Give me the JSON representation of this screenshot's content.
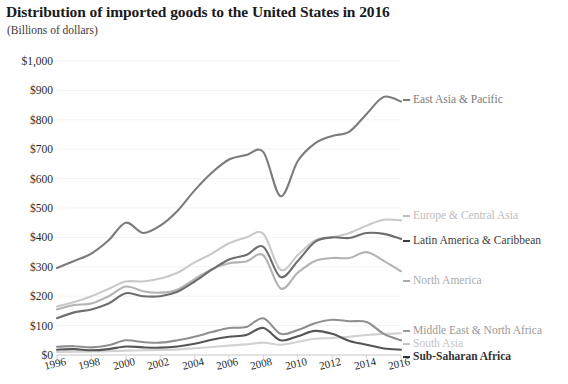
{
  "header": {
    "title": "Distribution of imported goods to the United States in 2016",
    "subtitle": "(Billions of dollars)"
  },
  "chart_data": {
    "type": "line",
    "title": "Distribution of imported goods to the United States in 2016",
    "subtitle": "(Billions of dollars)",
    "xlabel": "",
    "ylabel": "Billions of dollars",
    "xlim": [
      1996,
      2016
    ],
    "ylim": [
      0,
      1000
    ],
    "grid": true,
    "legend_position": "right-inline",
    "y_ticks": [
      "$0",
      "$100",
      "$200",
      "$300",
      "$400",
      "$500",
      "$600",
      "$700",
      "$800",
      "$900",
      "$1,000"
    ],
    "y_tick_values": [
      0,
      100,
      200,
      300,
      400,
      500,
      600,
      700,
      800,
      900,
      1000
    ],
    "x_ticks": [
      "1996",
      "1998",
      "2000",
      "2002",
      "2004",
      "2006",
      "2008",
      "2010",
      "2012",
      "2014",
      "2016"
    ],
    "x": [
      1996,
      1997,
      1998,
      1999,
      2000,
      2001,
      2002,
      2003,
      2004,
      2005,
      2006,
      2007,
      2008,
      2009,
      2010,
      2011,
      2012,
      2013,
      2014,
      2015,
      2016
    ],
    "series": [
      {
        "name": "East Asia & Pacific",
        "color": "#7b7b7b",
        "values": [
          296,
          320,
          345,
          390,
          450,
          415,
          440,
          490,
          560,
          620,
          665,
          680,
          690,
          540,
          660,
          720,
          745,
          760,
          820,
          878,
          862
        ]
      },
      {
        "name": "Europe & Central Asia",
        "color": "#c9c9c9",
        "values": [
          165,
          180,
          200,
          225,
          250,
          250,
          260,
          280,
          315,
          345,
          380,
          400,
          412,
          290,
          340,
          390,
          400,
          415,
          440,
          460,
          458
        ]
      },
      {
        "name": "Latin America & Caribbean",
        "color": "#6e6e6e",
        "values": [
          125,
          145,
          155,
          175,
          210,
          200,
          200,
          215,
          250,
          290,
          325,
          340,
          368,
          265,
          320,
          385,
          400,
          398,
          415,
          412,
          395
        ]
      },
      {
        "name": "North America",
        "color": "#b3b3b3",
        "values": [
          155,
          170,
          175,
          200,
          233,
          217,
          212,
          222,
          258,
          292,
          312,
          318,
          339,
          226,
          280,
          320,
          330,
          330,
          350,
          320,
          285
        ]
      },
      {
        "name": "Middle East & North Africa",
        "color": "#8f8f8f",
        "values": [
          28,
          30,
          26,
          33,
          50,
          44,
          42,
          50,
          62,
          78,
          92,
          95,
          125,
          72,
          85,
          108,
          120,
          115,
          112,
          72,
          50
        ]
      },
      {
        "name": "South Asia",
        "color": "#d2d2d2",
        "values": [
          10,
          11,
          12,
          13,
          15,
          16,
          17,
          19,
          23,
          27,
          32,
          36,
          42,
          35,
          45,
          55,
          58,
          62,
          68,
          72,
          74
        ]
      },
      {
        "name": "Sub-Saharan Africa",
        "color": "#555555",
        "values": [
          18,
          20,
          16,
          20,
          29,
          26,
          25,
          29,
          38,
          52,
          62,
          68,
          92,
          50,
          64,
          82,
          72,
          48,
          35,
          22,
          18
        ]
      }
    ],
    "series_labels": [
      {
        "name": "East Asia & Pacific",
        "color": "#7b7b7b",
        "x": 413,
        "y": 100
      },
      {
        "name": "Europe & Central Asia",
        "color": "#bdbdbd",
        "x": 413,
        "y": 216
      },
      {
        "name": "Latin America & Caribbean",
        "color": "#3d3d3d",
        "x": 413,
        "y": 241
      },
      {
        "name": "North America",
        "color": "#ababab",
        "x": 413,
        "y": 281
      },
      {
        "name": "Middle East & North Africa",
        "color": "#9a9a9a",
        "x": 413,
        "y": 331
      },
      {
        "name": "South Asia",
        "color": "#c4c4c4",
        "x": 413,
        "y": 344
      },
      {
        "name": "Sub-Saharan Africa",
        "color": "#333333",
        "x": 413,
        "y": 357
      }
    ]
  }
}
